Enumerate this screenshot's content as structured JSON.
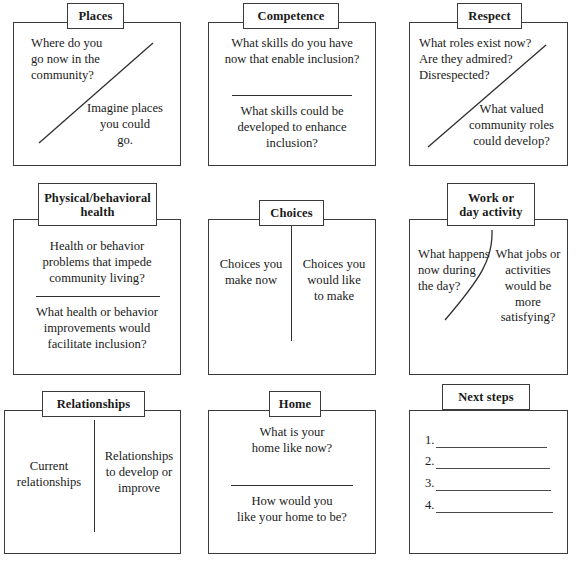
{
  "worksheet": {
    "title": "Person-centered planning domains worksheet",
    "panels": [
      {
        "id": "places",
        "tab_label": "Places",
        "divider": "diagonal",
        "blocks": [
          {
            "text": "Where do you\ngo now in the\ncommunity?",
            "align": "left"
          },
          {
            "text": "Imagine places\nyou could\ngo.",
            "align": "center"
          }
        ]
      },
      {
        "id": "competence",
        "tab_label": "Competence",
        "divider": "horizontal",
        "blocks": [
          {
            "text": "What skills do you have\nnow that enable inclusion?",
            "align": "center"
          },
          {
            "text": "What skills could be\ndeveloped to enhance\ninclusion?",
            "align": "center"
          }
        ]
      },
      {
        "id": "respect",
        "tab_label": "Respect",
        "divider": "diagonal",
        "blocks": [
          {
            "text": "What roles exist now?\nAre they admired?\nDisrespected?",
            "align": "left"
          },
          {
            "text": "What valued\ncommunity roles\ncould develop?",
            "align": "center"
          }
        ]
      },
      {
        "id": "physical-behavioral-health",
        "tab_label": "Physical/behavioral\nhealth",
        "divider": "horizontal",
        "blocks": [
          {
            "text": "Health or behavior\nproblems that impede\ncommunity living?",
            "align": "center"
          },
          {
            "text": "What health or behavior\nimprovements would\nfacilitate inclusion?",
            "align": "center"
          }
        ]
      },
      {
        "id": "choices",
        "tab_label": "Choices",
        "divider": "vertical",
        "blocks": [
          {
            "text": "Choices you\nmake now",
            "align": "center"
          },
          {
            "text": "Choices you\nwould like\nto make",
            "align": "center"
          }
        ]
      },
      {
        "id": "work-or-day-activity",
        "tab_label": "Work or\nday activity",
        "divider": "curved",
        "blocks": [
          {
            "text": "What happens\nnow during\nthe day?",
            "align": "left"
          },
          {
            "text": "What jobs or\nactivities\nwould be\nmore satisfying?",
            "align": "center"
          }
        ]
      },
      {
        "id": "relationships",
        "tab_label": "Relationships",
        "divider": "vertical",
        "blocks": [
          {
            "text": "Current\nrelationships",
            "align": "center"
          },
          {
            "text": "Relationships\nto develop or\nimprove",
            "align": "center"
          }
        ]
      },
      {
        "id": "home",
        "tab_label": "Home",
        "divider": "horizontal",
        "blocks": [
          {
            "text": "What is your\nhome like now?",
            "align": "center"
          },
          {
            "text": "How would you\nlike your home to be?",
            "align": "center"
          }
        ]
      },
      {
        "id": "next-steps",
        "tab_label": "Next steps",
        "divider": "none",
        "steps": [
          "1.",
          "2.",
          "3.",
          "4."
        ]
      }
    ]
  },
  "colors": {
    "border": "#3b3b3b",
    "rule": "#2f2f2f",
    "text": "#1a1a1a",
    "background": "#ffffff"
  }
}
